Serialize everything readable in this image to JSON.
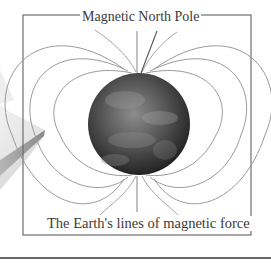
{
  "diagram": {
    "top_label": "Magnetic North Pole",
    "caption": "The Earth's lines of magnetic force",
    "elements": {
      "globe": "earth-globe",
      "field_lines_per_side": 3,
      "book": "book-edge-decoration"
    },
    "colors": {
      "frame": "#6e6e6e",
      "field_lines": "#9a9a9a",
      "leader_line": "#555555",
      "text": "#3a3a3a",
      "separator": "#333333"
    }
  }
}
